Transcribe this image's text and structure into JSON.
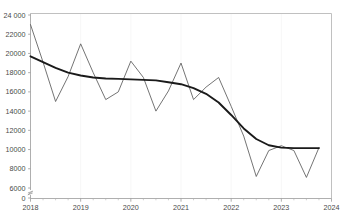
{
  "chart_data": {
    "type": "line",
    "title": "",
    "subtitle": "",
    "xlabel": "",
    "ylabel": "",
    "grid": true,
    "legend_position": "none",
    "axis_break": true,
    "xlim": [
      2018.0,
      2024.0
    ],
    "ylim": [
      6000,
      24000
    ],
    "yticks": [
      0,
      6000,
      8000,
      10000,
      12000,
      14000,
      16000,
      18000,
      20000,
      22000,
      24000
    ],
    "ytick_labels": [
      "0",
      "6000",
      "8000",
      "10000",
      "12000",
      "14000",
      "16000",
      "18000",
      "20000",
      "22000",
      "24 000"
    ],
    "xticks": [
      2018,
      2019,
      2020,
      2021,
      2022,
      2023,
      2024
    ],
    "xtick_labels": [
      "2018",
      "2019",
      "2020",
      "2021",
      "2022",
      "2023",
      "2024"
    ],
    "x_minor_per_major": 4,
    "colors": {
      "series_quarterly": "#5b5b5b",
      "series_trend": "#1a1a1a",
      "axis": "#9a9a9a",
      "border": "#b9b9b9",
      "grid": "#f4f4f4",
      "background": "#ffffff",
      "tick_text": "#4a4a4a"
    },
    "series": [
      {
        "name": "quarterly",
        "style": "thin",
        "x": [
          2018.0,
          2018.25,
          2018.5,
          2018.75,
          2019.0,
          2019.25,
          2019.5,
          2019.75,
          2020.0,
          2020.25,
          2020.5,
          2020.75,
          2021.0,
          2021.25,
          2021.5,
          2021.75,
          2022.0,
          2022.25,
          2022.5,
          2022.75,
          2023.0,
          2023.25,
          2023.5,
          2023.75
        ],
        "values": [
          23000,
          19100,
          15000,
          17600,
          21000,
          18000,
          15200,
          16000,
          19200,
          17500,
          14000,
          16100,
          19000,
          15200,
          16500,
          17500,
          14500,
          11400,
          7200,
          9900,
          10400,
          9900,
          7100,
          10200
        ]
      },
      {
        "name": "trend",
        "style": "thick",
        "x": [
          2018.0,
          2018.25,
          2018.5,
          2018.75,
          2019.0,
          2019.25,
          2019.5,
          2019.75,
          2020.0,
          2020.25,
          2020.5,
          2020.75,
          2021.0,
          2021.25,
          2021.5,
          2021.75,
          2022.0,
          2022.25,
          2022.5,
          2022.75,
          2023.0,
          2023.25,
          2023.5,
          2023.75
        ],
        "values": [
          19700,
          19100,
          18500,
          18000,
          17700,
          17500,
          17400,
          17350,
          17300,
          17250,
          17200,
          17000,
          16800,
          16400,
          15800,
          14900,
          13600,
          12200,
          11100,
          10450,
          10200,
          10150,
          10150,
          10150
        ]
      }
    ]
  }
}
